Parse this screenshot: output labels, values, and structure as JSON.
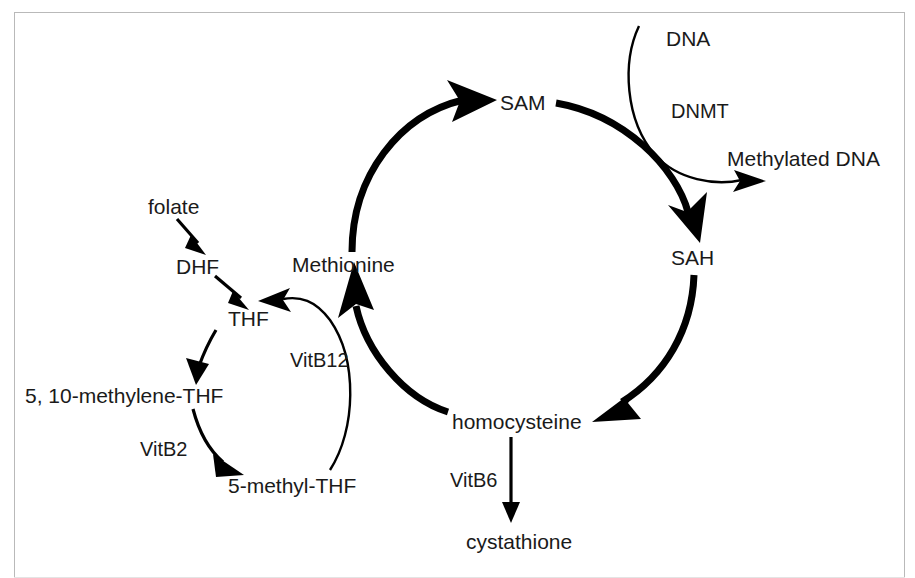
{
  "diagram": {
    "frame": {
      "border_color": "#b9b9b9",
      "background": "#ffffff"
    },
    "ink_color": "#000000",
    "text_color": "#1a1a1a",
    "metabolites": [
      {
        "id": "folate",
        "label": "folate",
        "x": 148,
        "y": 208
      },
      {
        "id": "dhf",
        "label": "DHF",
        "x": 176,
        "y": 268
      },
      {
        "id": "thf",
        "label": "THF",
        "x": 228,
        "y": 320
      },
      {
        "id": "methylene_thf",
        "label": "5, 10-methylene-THF",
        "x": 25,
        "y": 397
      },
      {
        "id": "methyl_thf",
        "label": "5-methyl-THF",
        "x": 228,
        "y": 487
      },
      {
        "id": "methionine",
        "label": "Methionine",
        "x": 292,
        "y": 266
      },
      {
        "id": "sam",
        "label": "SAM",
        "x": 500,
        "y": 104
      },
      {
        "id": "sah",
        "label": "SAH",
        "x": 671,
        "y": 259
      },
      {
        "id": "homocysteine",
        "label": "homocysteine",
        "x": 452,
        "y": 423
      },
      {
        "id": "cystathione",
        "label": "cystathione",
        "x": 466,
        "y": 543
      },
      {
        "id": "dna",
        "label": "DNA",
        "x": 666,
        "y": 40
      },
      {
        "id": "methylated_dna",
        "label": "Methylated DNA",
        "x": 727,
        "y": 160
      }
    ],
    "cofactors": [
      {
        "id": "vitb12",
        "label": "VitB12",
        "x": 290,
        "y": 362
      },
      {
        "id": "vitb2",
        "label": "VitB2",
        "x": 140,
        "y": 451
      },
      {
        "id": "vitb6",
        "label": "VitB6",
        "x": 450,
        "y": 482
      },
      {
        "id": "dnmt",
        "label": "DNMT",
        "x": 671,
        "y": 113
      }
    ],
    "reactions": [
      {
        "id": "folate-to-dhf",
        "from": "folate",
        "to": "dhf",
        "style": "thin"
      },
      {
        "id": "dhf-to-thf",
        "from": "dhf",
        "to": "thf",
        "style": "thin"
      },
      {
        "id": "thf-to-methylene",
        "from": "thf",
        "to": "methylene_thf",
        "style": "thin"
      },
      {
        "id": "methylene-to-methyl",
        "from": "methylene_thf",
        "to": "methyl_thf",
        "style": "thin",
        "cofactor": "vitb2"
      },
      {
        "id": "methyl-thf-to-thf",
        "from": "methyl_thf",
        "to": "thf",
        "style": "thin",
        "cofactor": "vitb12"
      },
      {
        "id": "methionine-to-sam",
        "from": "methionine",
        "to": "sam",
        "style": "thick"
      },
      {
        "id": "sam-to-sah",
        "from": "sam",
        "to": "sah",
        "style": "thick"
      },
      {
        "id": "sah-to-homocysteine",
        "from": "sah",
        "to": "homocysteine",
        "style": "thick"
      },
      {
        "id": "homocysteine-to-methionine",
        "from": "homocysteine",
        "to": "methionine",
        "style": "thick"
      },
      {
        "id": "homocysteine-to-cystathione",
        "from": "homocysteine",
        "to": "cystathione",
        "style": "thin",
        "cofactor": "vitb6"
      },
      {
        "id": "dna-to-methylated-dna",
        "from": "dna",
        "to": "methylated_dna",
        "style": "thin",
        "cofactor": "dnmt"
      }
    ]
  }
}
